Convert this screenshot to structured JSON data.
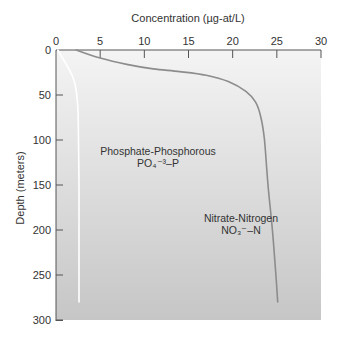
{
  "chart_data": {
    "type": "line",
    "title": "",
    "xlabel": "Concentration (µg-at/L)",
    "ylabel": "Depth (meters)",
    "x_axis_position": "top",
    "y_axis_inverted": true,
    "xlim": [
      0,
      30
    ],
    "ylim": [
      0,
      300
    ],
    "xticks": [
      0,
      5,
      10,
      15,
      20,
      25,
      30
    ],
    "yticks": [
      0,
      50,
      100,
      150,
      200,
      250,
      300
    ],
    "grid": false,
    "legend": "none (inline annotations)",
    "series": [
      {
        "name": "Phosphate-Phosphorous",
        "formula": "PO₄⁻³–P",
        "color": "#ffffff",
        "points": [
          {
            "x": 0.2,
            "depth": 0
          },
          {
            "x": 0.8,
            "depth": 10
          },
          {
            "x": 1.4,
            "depth": 20
          },
          {
            "x": 1.9,
            "depth": 30
          },
          {
            "x": 2.2,
            "depth": 40
          },
          {
            "x": 2.4,
            "depth": 55
          },
          {
            "x": 2.5,
            "depth": 70
          },
          {
            "x": 2.55,
            "depth": 100
          },
          {
            "x": 2.6,
            "depth": 150
          },
          {
            "x": 2.6,
            "depth": 200
          },
          {
            "x": 2.6,
            "depth": 250
          },
          {
            "x": 2.6,
            "depth": 280
          }
        ]
      },
      {
        "name": "Nitrate-Nitrogen",
        "formula": "NO₃⁻–N",
        "color": "#8c8c8c",
        "points": [
          {
            "x": 2.3,
            "depth": 0
          },
          {
            "x": 5.0,
            "depth": 9
          },
          {
            "x": 8.0,
            "depth": 16
          },
          {
            "x": 11.0,
            "depth": 21
          },
          {
            "x": 14.0,
            "depth": 24
          },
          {
            "x": 17.0,
            "depth": 28
          },
          {
            "x": 19.5,
            "depth": 35
          },
          {
            "x": 21.5,
            "depth": 46
          },
          {
            "x": 22.6,
            "depth": 58
          },
          {
            "x": 23.2,
            "depth": 75
          },
          {
            "x": 23.6,
            "depth": 100
          },
          {
            "x": 24.0,
            "depth": 150
          },
          {
            "x": 24.5,
            "depth": 200
          },
          {
            "x": 24.9,
            "depth": 250
          },
          {
            "x": 25.1,
            "depth": 280
          }
        ]
      }
    ],
    "annotations": [
      {
        "text": "Phosphate-Phosphorous",
        "x": 11.5,
        "depth": 112
      },
      {
        "text": "PO₄⁻³–P",
        "x": 11.5,
        "depth": 125
      },
      {
        "text": "Nitrate-Nitrogen",
        "x": 22.0,
        "depth": 190
      },
      {
        "text": "NO₃⁻–N",
        "x": 22.0,
        "depth": 203
      }
    ]
  },
  "labels": {
    "xlabel": "Concentration (µg-at/L)",
    "ylabel": "Depth (meters)",
    "phosphate_name": "Phosphate-Phosphorous",
    "phosphate_formula": "PO₄⁻³–P",
    "nitrate_name": "Nitrate-Nitrogen",
    "nitrate_formula": "NO₃⁻–N"
  },
  "colors": {
    "plot_bg_top": "#f4f4f4",
    "plot_bg_bottom": "#c6c6c6",
    "axis": "#555555",
    "text": "#333333"
  }
}
